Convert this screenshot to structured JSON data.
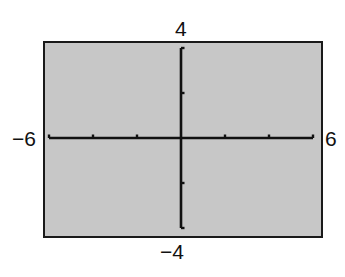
{
  "window": {
    "xmin_label": "−6",
    "xmax_label": "6",
    "ymin_label": "−4",
    "ymax_label": "4",
    "background_color": "#c7c7c7",
    "frame_color": "#1a1a1a",
    "axis_color": "#111111"
  },
  "chart_data": {
    "type": "line",
    "title": "",
    "xlabel": "",
    "ylabel": "",
    "xlim": [
      -6,
      6
    ],
    "ylim": [
      -4,
      4
    ],
    "xscl": 2,
    "yscl": 2,
    "x_ticks": [
      -6,
      -4,
      -2,
      0,
      2,
      4,
      6
    ],
    "y_ticks": [
      -4,
      -2,
      0,
      2,
      4
    ],
    "tick_labels": {
      "left": "−6",
      "right": "6",
      "top": "4",
      "bottom": "−4"
    },
    "series": [],
    "grid": false,
    "legend": null
  }
}
